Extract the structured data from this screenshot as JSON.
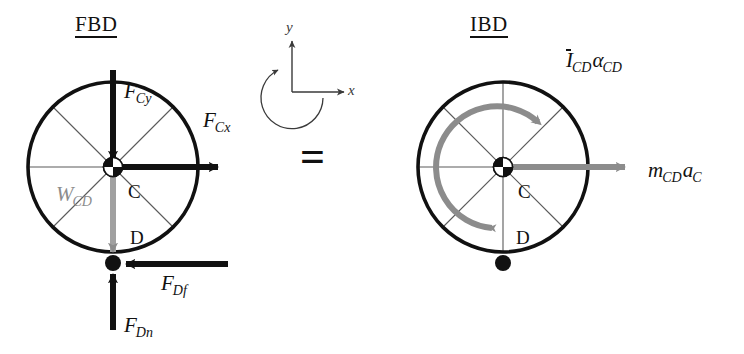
{
  "figure": {
    "kind": "free-body-diagram-and-inertial-body-diagram",
    "equals_symbol": "=",
    "background_color": "#ffffff",
    "ink_color": "#111111",
    "gray_color": "#8c8c8c",
    "axis_color": "#3a3a3a"
  },
  "axes_key": {
    "x_label": "x",
    "y_label": "y",
    "rotation_sense": "counterclockwise"
  },
  "fbd": {
    "title": "FBD",
    "center_point_label": "C",
    "contact_point_label": "D",
    "forces": [
      {
        "name": "F",
        "sub": "Cy",
        "label": "F_Cy",
        "direction": "down",
        "color": "#111111",
        "applied_at": "C"
      },
      {
        "name": "F",
        "sub": "Cx",
        "label": "F_Cx",
        "direction": "right",
        "color": "#111111",
        "applied_at": "C"
      },
      {
        "name": "W",
        "sub": "CD",
        "label": "W_CD",
        "direction": "down",
        "color": "#8c8c8c",
        "applied_at": "C"
      },
      {
        "name": "F",
        "sub": "Df",
        "label": "F_Df",
        "direction": "left",
        "color": "#111111",
        "applied_at": "D"
      },
      {
        "name": "F",
        "sub": "Dn",
        "label": "F_Dn",
        "direction": "up",
        "color": "#111111",
        "applied_at": "D"
      }
    ]
  },
  "ibd": {
    "title": "IBD",
    "center_point_label": "C",
    "contact_point_label": "D",
    "terms": [
      {
        "name": "I",
        "overbar": true,
        "sub1": "CD",
        "greek": "α",
        "sub2": "CD",
        "label": "I_CD alpha_CD",
        "direction": "counterclockwise-arc",
        "color": "#8c8c8c"
      },
      {
        "name": "m",
        "sub1": "CD",
        "name2": "a",
        "sub2": "C",
        "label": "m_CD a_C",
        "direction": "right",
        "color": "#8c8c8c"
      }
    ]
  }
}
